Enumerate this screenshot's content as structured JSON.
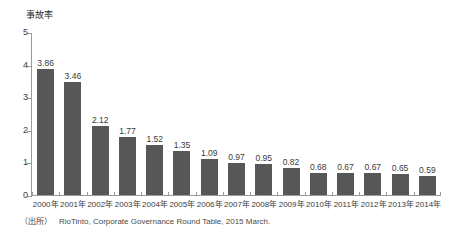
{
  "chart_data": {
    "type": "bar",
    "title": "",
    "subtitle": "",
    "xlabel": "",
    "ylabel": "事故率",
    "ylim": [
      0,
      5
    ],
    "ytick_labels": [
      "5",
      "4",
      "3",
      "2",
      "1",
      "0"
    ],
    "ytick_values": [
      5,
      4,
      3,
      2,
      1,
      0
    ],
    "grid": false,
    "legend": null,
    "bar_color": "#575757",
    "axis_color": "#9a9a9a",
    "text_color": "#3a3a3a",
    "categories": [
      "2000年",
      "2001年",
      "2002年",
      "2003年",
      "2004年",
      "2005年",
      "2006年",
      "2007年",
      "2008年",
      "2009年",
      "2010年",
      "2011年",
      "2012年",
      "2013年",
      "2014年"
    ],
    "values": [
      3.86,
      3.46,
      2.12,
      1.77,
      1.52,
      1.35,
      1.09,
      0.97,
      0.95,
      0.82,
      0.68,
      0.67,
      0.67,
      0.65,
      0.59
    ],
    "value_labels": [
      "3.86",
      "3.46",
      "2.12",
      "1.77",
      "1.52",
      "1.35",
      "1.09",
      "0.97",
      "0.95",
      "0.82",
      "0.68",
      "0.67",
      "0.67",
      "0.65",
      "0.59"
    ]
  },
  "source_note": {
    "label": "（出所）",
    "text": "RioTinto, Corporate Governance Round Table, 2015 March."
  }
}
